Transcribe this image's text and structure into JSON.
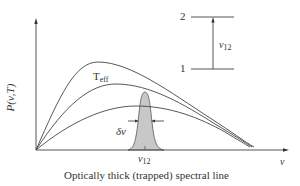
{
  "diagram": {
    "type": "physics-spectrum-diagram",
    "y_axis_label": "P(ν,T)",
    "x_axis_label": "ν",
    "curve_label": {
      "main": "T",
      "sub": "eff"
    },
    "linewidth_label": "δν",
    "line_center_label": {
      "main": "ν",
      "sub": "12"
    },
    "caption": "Optically thick (trapped) spectral line",
    "energy_levels": {
      "upper_label": "2",
      "lower_label": "1",
      "transition_label": {
        "main": "ν",
        "sub": "12"
      }
    },
    "curves": [
      {
        "name": "hot-planck-curve",
        "description": "highest temperature blackbody curve"
      },
      {
        "name": "teff-planck-curve",
        "description": "blackbody curve at effective temperature T_eff"
      },
      {
        "name": "cool-planck-curve",
        "description": "lowest temperature blackbody curve"
      }
    ],
    "line_profile": {
      "shape": "gaussian",
      "fill_color": "#c8c8c8",
      "stroke_color": "#555555"
    },
    "colors": {
      "stroke": "#444444",
      "fill": "#c8c8c8",
      "background": "#ffffff"
    }
  }
}
